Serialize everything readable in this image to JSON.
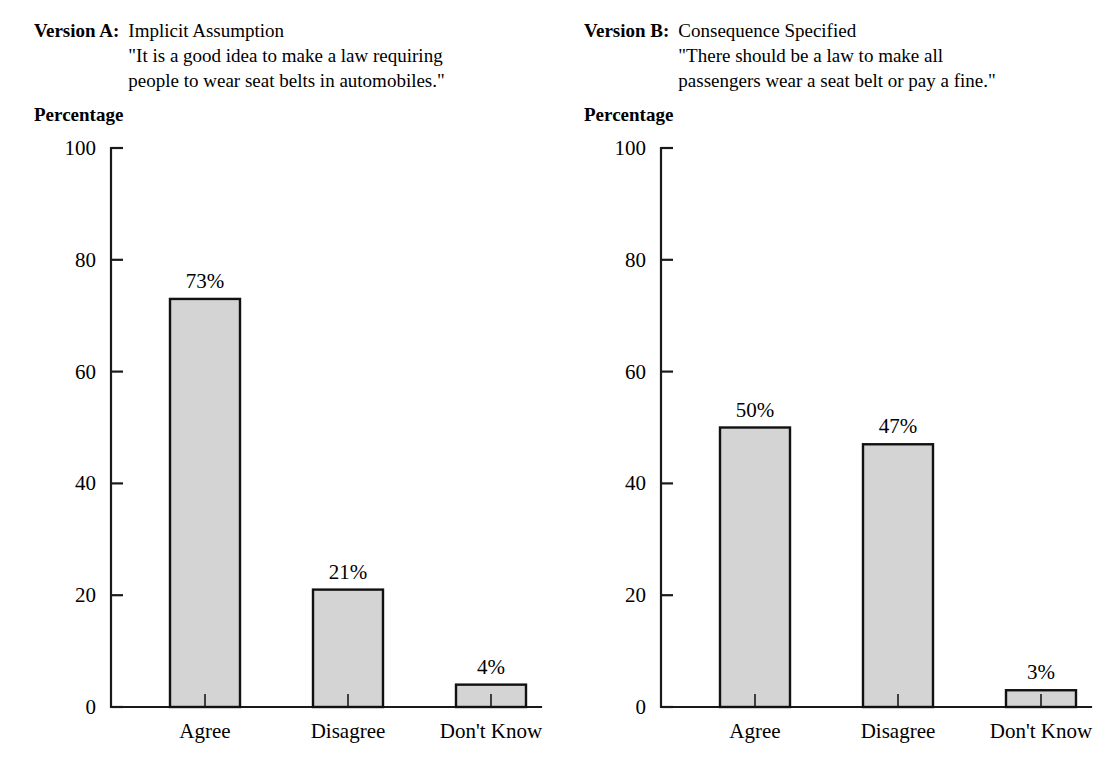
{
  "panels": [
    {
      "version_label": "Version A:",
      "subtitle": "Implicit Assumption",
      "quote_line1": "\"It is a good idea to make a law requiring",
      "quote_line2": "people to wear seat belts in automobiles.\"",
      "y_axis_caption": "Percentage"
    },
    {
      "version_label": "Version B:",
      "subtitle": "Consequence Specified",
      "quote_line1": "\"There should be a law to make all",
      "quote_line2": "passengers wear a seat belt or pay a fine.\"",
      "y_axis_caption": "Percentage"
    }
  ],
  "chart_data": [
    {
      "type": "bar",
      "title": "Version A: Implicit Assumption",
      "subtitle": "\"It is a good idea to make a law requiring people to wear seat belts in automobiles.\"",
      "categories": [
        "Agree",
        "Disagree",
        "Don't Know"
      ],
      "values": [
        73,
        21,
        4
      ],
      "data_labels": [
        "73%",
        "21%",
        "4%"
      ],
      "xlabel": "",
      "ylabel": "Percentage",
      "ylim": [
        0,
        100
      ],
      "yticks": [
        0,
        20,
        40,
        60,
        80,
        100
      ],
      "ytick_labels": [
        "0",
        "20",
        "40",
        "60",
        "80",
        "100"
      ],
      "grid": false,
      "legend": false,
      "bar_fill": "#d4d4d4",
      "bar_edge": "#111111"
    },
    {
      "type": "bar",
      "title": "Version B: Consequence Specified",
      "subtitle": "\"There should be a law to make all passengers wear a seat belt or pay a fine.\"",
      "categories": [
        "Agree",
        "Disagree",
        "Don't Know"
      ],
      "values": [
        50,
        47,
        3
      ],
      "data_labels": [
        "50%",
        "47%",
        "3%"
      ],
      "xlabel": "",
      "ylabel": "Percentage",
      "ylim": [
        0,
        100
      ],
      "yticks": [
        0,
        20,
        40,
        60,
        80,
        100
      ],
      "ytick_labels": [
        "0",
        "20",
        "40",
        "60",
        "80",
        "100"
      ],
      "grid": false,
      "legend": false,
      "bar_fill": "#d4d4d4",
      "bar_edge": "#111111"
    }
  ]
}
